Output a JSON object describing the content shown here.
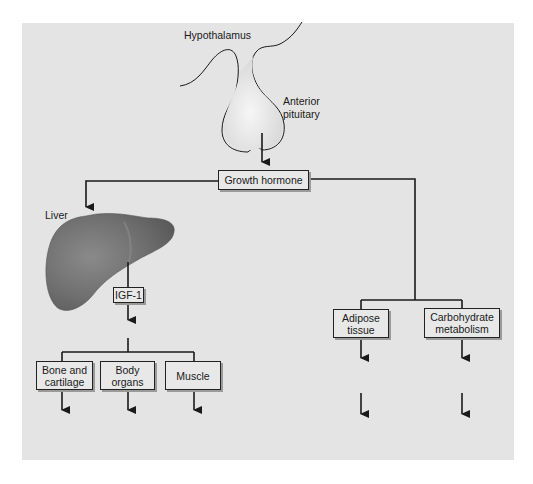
{
  "diagram": {
    "colors": {
      "panel_background": "#e4e4e4",
      "line": "#1a1a1a",
      "liver_fill": "#7d7d7d",
      "pituitary_fill": "#ededed"
    },
    "labels": {
      "hypothalamus": "Hypothalamus",
      "anterior_pituitary_line1": "Anterior",
      "anterior_pituitary_line2": "pituitary",
      "liver": "Liver"
    },
    "nodes": {
      "growth_hormone": "Growth hormone",
      "igf1": "IGF-1",
      "bone_line1": "Bone and",
      "bone_line2": "cartilage",
      "body_line1": "Body",
      "body_line2": "organs",
      "muscle": "Muscle",
      "adipose_line1": "Adipose",
      "adipose_line2": "tissue",
      "carb_line1": "Carbohydrate",
      "carb_line2": "metabolism"
    },
    "edges": [
      {
        "from": "Anterior pituitary",
        "to": "Growth hormone"
      },
      {
        "from": "Growth hormone",
        "to": "Liver"
      },
      {
        "from": "Liver",
        "to": "IGF-1"
      },
      {
        "from": "IGF-1",
        "to": "Bone and cartilage"
      },
      {
        "from": "IGF-1",
        "to": "Body organs"
      },
      {
        "from": "IGF-1",
        "to": "Muscle"
      },
      {
        "from": "Growth hormone",
        "to": "Adipose tissue"
      },
      {
        "from": "Growth hormone",
        "to": "Carbohydrate metabolism"
      }
    ]
  }
}
